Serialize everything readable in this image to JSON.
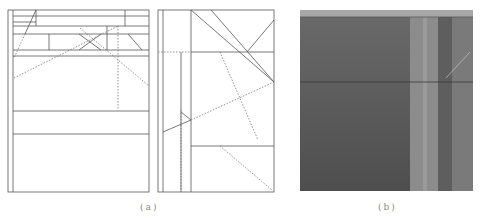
{
  "figure": {
    "panels": [
      {
        "id": "a",
        "label": "(a)",
        "description": "line drawing of architectural interior elevations (two panels)"
      },
      {
        "id": "b",
        "label": "(b)",
        "description": "grayscale photograph of interior wall surface"
      }
    ]
  },
  "colors": {
    "line": "#555555",
    "dotted": "#777777",
    "photo_dark": "#5a5a5a",
    "photo_mid": "#6e6e6e",
    "photo_light": "#8c8c8c",
    "photo_top": "#a8a8a8"
  }
}
